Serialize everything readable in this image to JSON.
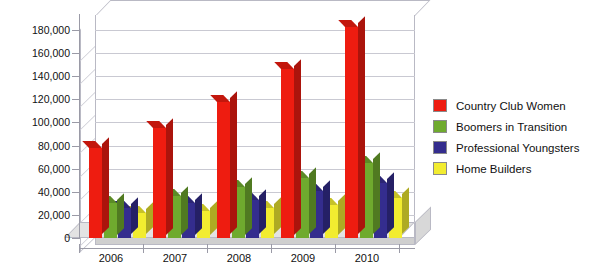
{
  "chart_data": {
    "type": "bar",
    "title": "",
    "xlabel": "",
    "ylabel": "",
    "categories": [
      "2006",
      "2007",
      "2008",
      "2009",
      "2010"
    ],
    "ylim": [
      0,
      180000
    ],
    "yticks": [
      0,
      20000,
      40000,
      60000,
      80000,
      100000,
      120000,
      140000,
      160000,
      180000
    ],
    "ytick_labels": [
      "0",
      "20,000",
      "40,000",
      "60,000",
      "80,000",
      "100,000",
      "120,000",
      "140,000",
      "160,000",
      "180,000"
    ],
    "grid": true,
    "legend_position": "right",
    "three_d": true,
    "series": [
      {
        "name": "Country Club Women",
        "color": "#ee1c10",
        "values": [
          78000,
          95000,
          118000,
          146000,
          183000
        ]
      },
      {
        "name": "Boomers in Transition",
        "color": "#6faa2e",
        "values": [
          30000,
          36000,
          44000,
          52000,
          65000
        ]
      },
      {
        "name": "Professional Youngsters",
        "color": "#342d8e",
        "values": [
          26000,
          30000,
          33000,
          41000,
          48000
        ]
      },
      {
        "name": "Home Builders",
        "color": "#f2ec30",
        "values": [
          22000,
          23000,
          26000,
          29000,
          35000
        ]
      }
    ]
  },
  "legend": {
    "items": [
      {
        "label": "Country Club Women",
        "color": "#ee1c10"
      },
      {
        "label": "Boomers in Transition",
        "color": "#6faa2e"
      },
      {
        "label": "Professional Youngsters",
        "color": "#342d8e"
      },
      {
        "label": "Home Builders",
        "color": "#f2ec30"
      }
    ]
  }
}
